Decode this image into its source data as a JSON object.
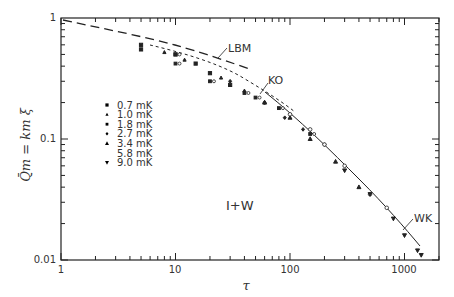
{
  "chart_data": {
    "type": "scatter",
    "title": "",
    "xlabel": "τ",
    "ylabel": "Q̄m = km ξ",
    "xscale": "log",
    "yscale": "log",
    "xlim": [
      1,
      2000
    ],
    "ylim": [
      0.01,
      1
    ],
    "x_ticks": [
      "1",
      "10",
      "100",
      "1000"
    ],
    "y_ticks": [
      "0.01",
      "0.1",
      "1"
    ],
    "grid": false,
    "annotation": "I+W",
    "legend": {
      "position": "upper-left-inside",
      "entries": [
        "0.7 mK",
        "1.0 mK",
        "1.8 mK",
        "2.7 mK",
        "3.4 mK",
        "5.8 mK",
        "9.0 mK"
      ]
    },
    "curves": [
      {
        "name": "LBM",
        "style": "long-dashed",
        "x": [
          1,
          3,
          10,
          30,
          50
        ],
        "y": [
          0.98,
          0.8,
          0.62,
          0.46,
          0.39
        ]
      },
      {
        "name": "KO",
        "style": "short-dashed",
        "x": [
          5,
          10,
          30,
          60,
          100,
          200
        ],
        "y": [
          0.6,
          0.53,
          0.35,
          0.24,
          0.17,
          0.1
        ]
      },
      {
        "name": "WK",
        "style": "solid",
        "x": [
          60,
          100,
          200,
          400,
          700,
          1000,
          1400
        ],
        "y": [
          0.22,
          0.16,
          0.09,
          0.045,
          0.025,
          0.017,
          0.011
        ]
      }
    ],
    "series": [
      {
        "name": "0.7 mK",
        "marker": "square-filled",
        "x": [
          5,
          5,
          10,
          15,
          20,
          30
        ],
        "y": [
          0.6,
          0.55,
          0.5,
          0.42,
          0.35,
          0.28
        ]
      },
      {
        "name": "1.0 mK",
        "marker": "triangle-up-small",
        "x": [
          8,
          12,
          25,
          40,
          60
        ],
        "y": [
          0.52,
          0.45,
          0.32,
          0.25,
          0.2
        ]
      },
      {
        "name": "1.8 mK",
        "marker": "square-and-circle",
        "x": [
          10,
          10,
          20,
          40,
          50,
          80,
          150
        ],
        "y": [
          0.5,
          0.42,
          0.3,
          0.24,
          0.22,
          0.18,
          0.11
        ]
      },
      {
        "name": "2.7 mK",
        "marker": "diamond-small",
        "x": [
          30,
          60,
          90,
          130,
          200
        ],
        "y": [
          0.3,
          0.2,
          0.15,
          0.12,
          0.09
        ]
      },
      {
        "name": "3.4 mK",
        "marker": "triangle-up-filled",
        "x": [
          60,
          100,
          150,
          250,
          400
        ],
        "y": [
          0.2,
          0.15,
          0.1,
          0.065,
          0.04
        ]
      },
      {
        "name": "5.8 mK",
        "marker": "circle-open",
        "x": [
          100,
          150,
          200,
          300,
          500,
          700
        ],
        "y": [
          0.16,
          0.12,
          0.09,
          0.06,
          0.035,
          0.027
        ]
      },
      {
        "name": "9.0 mK",
        "marker": "triangle-down-filled",
        "x": [
          300,
          500,
          800,
          1000,
          1300,
          1400
        ],
        "y": [
          0.055,
          0.035,
          0.022,
          0.016,
          0.012,
          0.011
        ]
      }
    ]
  },
  "labels": {
    "x_axis": "τ",
    "y_axis": "Q̄m = km ξ",
    "annotation": "I+W",
    "curve_lbm": "LBM",
    "curve_ko": "KO",
    "curve_wk": "WK",
    "tick_x_1": "1",
    "tick_x_10": "10",
    "tick_x_100": "100",
    "tick_x_1000": "1000",
    "tick_y_1": "1",
    "tick_y_01": "0.1",
    "tick_y_001": "0.01",
    "legend": [
      "0.7 mK",
      "1.0 mK",
      "1.8 mK",
      "2.7 mK",
      "3.4 mK",
      "5.8 mK",
      "9.0 mK"
    ]
  }
}
